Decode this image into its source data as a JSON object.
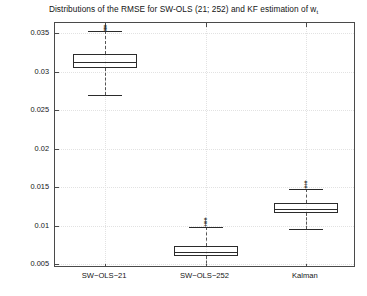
{
  "chart_data": {
    "type": "boxplot",
    "title": "Distributions of the RMSE for SW-OLS (21; 252) and KF estimation of w",
    "title_subscript": "t",
    "xlabel": "",
    "ylabel": "",
    "categories": [
      "SW−OLS−21",
      "SW−OLS−252",
      "Kalman"
    ],
    "ylim": [
      0.0045,
      0.0363
    ],
    "yticks": [
      0.005,
      0.01,
      0.015,
      0.02,
      0.025,
      0.03,
      0.035
    ],
    "ytick_labels": [
      "0.005",
      "0.01",
      "0.015",
      "0.02",
      "0.025",
      "0.03",
      "0.035"
    ],
    "grid": true,
    "legend": null,
    "boxes": [
      {
        "name": "SW−OLS−21",
        "whisker_low": 0.027,
        "q1": 0.0305,
        "median": 0.0313,
        "q3": 0.0323,
        "whisker_high": 0.0352,
        "outliers": [
          0.0354,
          0.0355,
          0.0356,
          0.0357,
          0.0358,
          0.0359,
          0.036
        ]
      },
      {
        "name": "SW−OLS−252",
        "whisker_low": 0.0045,
        "q1": 0.006,
        "median": 0.0066,
        "q3": 0.0073,
        "whisker_high": 0.0098,
        "outliers": [
          0.0101,
          0.0103,
          0.0105,
          0.0106,
          0.0108,
          0.011
        ]
      },
      {
        "name": "Kalman",
        "whisker_low": 0.0095,
        "q1": 0.0117,
        "median": 0.0122,
        "q3": 0.013,
        "whisker_high": 0.0148,
        "outliers": [
          0.015,
          0.0152,
          0.0154,
          0.0156,
          0.0158
        ]
      }
    ],
    "colors": {
      "axis": "#4a4a4a",
      "box": "#2b2b2b",
      "whisker": "#555555",
      "grid": "#e2e2e2",
      "background": "#ffffff",
      "text": "#141414"
    }
  }
}
